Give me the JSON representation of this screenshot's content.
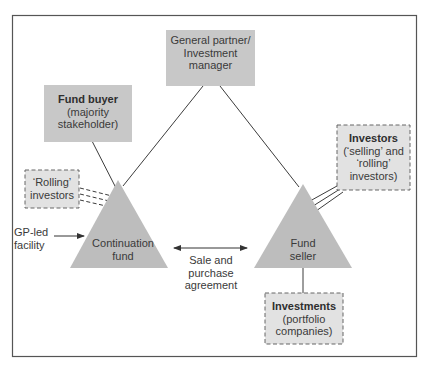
{
  "colors": {
    "box_fill": "#c8c8c8",
    "dashed_box_fill": "#e2e2e2",
    "triangle_fill": "#bdbdbd",
    "line": "#3c3c3c",
    "frame": "#555555"
  },
  "nodes": {
    "general_partner": {
      "line1": "General partner/",
      "line2": "Investment",
      "line3": "manager"
    },
    "fund_buyer": {
      "title": "Fund buyer",
      "line2": "(majority",
      "line3": "stakeholder)"
    },
    "rolling_investors": {
      "line1": "‘Rolling’",
      "line2": "investors"
    },
    "investors": {
      "title": "Investors",
      "line2": "(‘selling’ and",
      "line3": "‘rolling’",
      "line4": "investors)"
    },
    "investments": {
      "title": "Investments",
      "line2": "(portfolio",
      "line3": "companies)"
    },
    "continuation_fund": {
      "line1": "Continuation",
      "line2": "fund"
    },
    "fund_seller": {
      "line1": "Fund",
      "line2": "seller"
    }
  },
  "annotations": {
    "gp_led_facility": {
      "line1": "GP-led",
      "line2": "facility"
    },
    "sale_and_purchase": {
      "line1": "Sale and",
      "line2": "purchase",
      "line3": "agreement"
    }
  }
}
